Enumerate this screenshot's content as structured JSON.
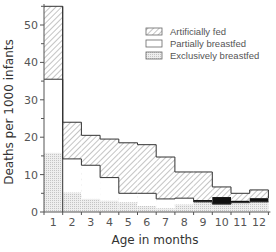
{
  "chart_data": {
    "type": "bar",
    "subtype": "stacked-step-histogram",
    "title": "",
    "xlabel": "Age in months",
    "ylabel": "Deaths per 1000 infants",
    "categories": [
      "1",
      "2",
      "3",
      "4",
      "5",
      "6",
      "7",
      "8",
      "9",
      "10",
      "11",
      "12"
    ],
    "ylim": [
      0,
      55
    ],
    "yticks": [
      0,
      10,
      20,
      30,
      40,
      50
    ],
    "grid": false,
    "legend_position": "upper right",
    "series": [
      {
        "name": "Artificially fed",
        "pattern": "hatched",
        "values": [
          55,
          24,
          20.5,
          19.5,
          18.5,
          18,
          14.7,
          10.7,
          10.7,
          6.7,
          5,
          5.9
        ]
      },
      {
        "name": "Partially breastfed",
        "pattern": "white",
        "values": [
          35.5,
          14.2,
          12.5,
          9.2,
          5,
          5,
          3.5,
          3.7,
          2.7,
          2.1,
          2.5,
          2.7
        ]
      },
      {
        "name": "Exclusively breastfed",
        "pattern": "dotted",
        "values": [
          15.8,
          5.2,
          3.5,
          3,
          2.6,
          1.6,
          1,
          2,
          3.2,
          4,
          3,
          3.7
        ]
      }
    ]
  },
  "legend": {
    "items": [
      {
        "label": "Artificially fed",
        "swatch": "hatched"
      },
      {
        "label": "Partially breastfed",
        "swatch": "white"
      },
      {
        "label": "Exclusively breastfed",
        "swatch": "dotted"
      }
    ]
  },
  "axes": {
    "x_title": "Age in months",
    "y_title": "Deaths per 1000 infants",
    "x_ticks": [
      "1",
      "2",
      "3",
      "4",
      "5",
      "6",
      "7",
      "8",
      "9",
      "10",
      "11",
      "12"
    ],
    "y_ticks": [
      "0",
      "10",
      "20",
      "30",
      "40",
      "50"
    ]
  },
  "colors": {
    "line": "#333333",
    "hatch": "#888888",
    "dots": "#cfcfcf",
    "black_band": "#111111"
  }
}
